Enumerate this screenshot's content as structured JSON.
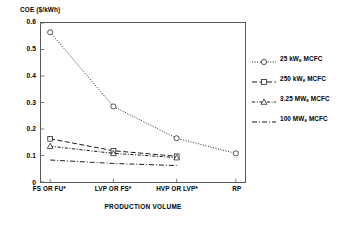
{
  "chart_data": {
    "type": "line",
    "title": "",
    "ylabel": "COE ($/kWh)",
    "xlabel": "PRODUCTION VOLUME",
    "categories": [
      "FS OR FU*",
      "LVP OR FS*",
      "HVP OR LVP*",
      "RP"
    ],
    "ylim": [
      0,
      0.6
    ],
    "yticks": [
      "0",
      "0.1",
      "0.2",
      "0.3",
      "0.4",
      "0.5",
      "0.6"
    ],
    "ytick_values": [
      0,
      0.1,
      0.2,
      0.3,
      0.4,
      0.5,
      0.6
    ],
    "grid": false,
    "legend_position": "right",
    "series": [
      {
        "name": "25 kWe MCFC",
        "label_main": "25 kW",
        "label_sub": "e",
        "label_tail": " MCFC",
        "marker": "circle",
        "linestyle": "dotted",
        "color": "#1a1a1a",
        "x": [
          "FS OR FU*",
          "LVP OR FS*",
          "HVP OR LVP*",
          "RP"
        ],
        "values": [
          0.565,
          0.285,
          0.165,
          0.108
        ]
      },
      {
        "name": "250 kWe MCFC",
        "label_main": "250 kW",
        "label_sub": "e",
        "label_tail": " MCFC",
        "marker": "square",
        "linestyle": "dashed",
        "color": "#1a1a1a",
        "x": [
          "FS OR FU*",
          "LVP OR FS*",
          "HVP OR LVP*"
        ],
        "values": [
          0.163,
          0.118,
          0.097
        ]
      },
      {
        "name": "3.25 MWe MCFC",
        "label_main": "3.25 MW",
        "label_sub": "e",
        "label_tail": " MCFC",
        "marker": "triangle",
        "linestyle": "dashdot-fine",
        "color": "#1a1a1a",
        "x": [
          "FS OR FU*",
          "LVP OR FS*",
          "HVP OR LVP*"
        ],
        "values": [
          0.135,
          0.108,
          0.092
        ]
      },
      {
        "name": "100 MWe MCFC",
        "label_main": "100 MW",
        "label_sub": "e",
        "label_tail": " MCFC",
        "marker": "none",
        "linestyle": "dashdot",
        "color": "#1a1a1a",
        "x": [
          "FS OR FU*",
          "LVP OR FS*",
          "HVP OR LVP*"
        ],
        "values": [
          0.083,
          0.07,
          0.062
        ]
      }
    ]
  },
  "axes": {
    "y_title": "COE ($/kWh)",
    "x_title": "PRODUCTION VOLUME"
  },
  "colors": {
    "line": "#1a1a1a",
    "frame": "#5a5a5a",
    "background": "#ffffff"
  }
}
